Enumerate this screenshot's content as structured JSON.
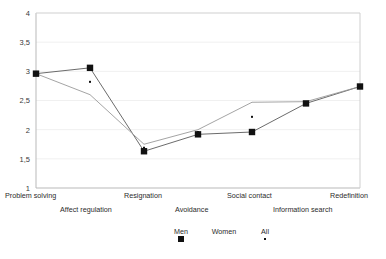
{
  "chart_data": {
    "type": "line",
    "title": "",
    "xlabel": "",
    "ylabel": "",
    "ylim": [
      1,
      4
    ],
    "yticks": [
      1,
      1.5,
      2,
      2.5,
      3,
      3.5,
      4
    ],
    "ytick_labels": [
      "1",
      "1,5",
      "2",
      "2,5",
      "3",
      "3,5",
      "4"
    ],
    "grid": true,
    "legend_position": "bottom",
    "categories": [
      "Problem solving",
      "Affect regulation",
      "Resignation",
      "Avoidance",
      "Social contact",
      "Information search",
      "Redefinition"
    ],
    "series": [
      {
        "name": "Men",
        "marker": "filled-square",
        "values": [
          2.96,
          3.06,
          1.63,
          1.92,
          1.96,
          2.45,
          2.74
        ]
      },
      {
        "name": "Women",
        "marker": "line",
        "values": [
          2.96,
          2.6,
          1.75,
          2.0,
          2.47,
          2.48,
          2.74
        ]
      },
      {
        "name": "All",
        "marker": "small-dot",
        "values": [
          2.96,
          2.82,
          1.69,
          1.96,
          2.22,
          2.46,
          2.74
        ]
      }
    ]
  },
  "legend": {
    "entries": [
      {
        "label": "Men"
      },
      {
        "label": "Women"
      },
      {
        "label": "All"
      }
    ]
  }
}
